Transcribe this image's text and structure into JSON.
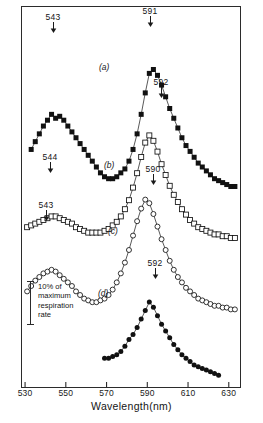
{
  "figure": {
    "axis": {
      "x_title": "Wavelength(nm)",
      "x_ticks": [
        530,
        550,
        570,
        590,
        610,
        630
      ],
      "x_min": 528,
      "x_max": 636
    },
    "scale_bar": {
      "label": "10% of\nmaximum\nrespiration\nrate",
      "fraction_of_axis": 0.1
    },
    "curve_tags": [
      {
        "label": "(a)",
        "x": 99,
        "y": 62
      },
      {
        "label": "(b)",
        "x": 104,
        "y": 160
      },
      {
        "label": "(c)",
        "x": 108,
        "y": 226
      },
      {
        "label": "(d)",
        "x": 98,
        "y": 288
      }
    ],
    "peaks": [
      {
        "label": "543",
        "x": 53,
        "y": 13,
        "series": "a"
      },
      {
        "label": "591",
        "x": 150,
        "y": 7,
        "series": "a"
      },
      {
        "label": "592",
        "x": 161,
        "y": 78,
        "series": "b"
      },
      {
        "label": "544",
        "x": 50,
        "y": 153,
        "series": "b"
      },
      {
        "label": "590",
        "x": 153,
        "y": 165,
        "series": "c"
      },
      {
        "label": "543",
        "x": 46,
        "y": 201,
        "series": "c"
      },
      {
        "label": "592",
        "x": 155,
        "y": 259,
        "series": "d"
      }
    ]
  },
  "chart_data": {
    "type": "line",
    "title": "",
    "xlabel": "Wavelength(nm)",
    "ylabel": "Respiration rate (relative, offset traces)",
    "xlim": [
      528,
      636
    ],
    "grid": false,
    "legend": "none",
    "annotations": [
      "543",
      "591",
      "592",
      "544",
      "590",
      "543",
      "592",
      "(a)",
      "(b)",
      "(c)",
      "(d)",
      "10% of maximum respiration rate"
    ],
    "series": [
      {
        "name": "(a)",
        "marker": "filled-square",
        "color": "#111111",
        "peaks_nm": [
          543,
          591
        ],
        "x": [
          533,
          535,
          537,
          539,
          541,
          543,
          545,
          547,
          549,
          551,
          553,
          555,
          557,
          559,
          561,
          563,
          565,
          567,
          569,
          571,
          573,
          575,
          577,
          579,
          581,
          583,
          585,
          587,
          589,
          591,
          593,
          595,
          597,
          599,
          601,
          603,
          605,
          607,
          609,
          611,
          613,
          615,
          617,
          619,
          621,
          623,
          625,
          627,
          629,
          631,
          633
        ],
        "y": [
          29,
          33,
          37,
          41,
          44,
          47,
          45,
          46,
          44,
          41,
          38,
          35,
          32,
          29,
          26,
          23,
          20,
          17,
          15,
          14,
          14,
          15,
          17,
          19,
          23,
          29,
          37,
          47,
          58,
          68,
          70,
          67,
          62,
          56,
          50,
          45,
          40,
          35,
          31,
          28,
          25,
          22,
          20,
          18,
          16,
          14,
          13,
          12,
          11,
          10,
          10
        ]
      },
      {
        "name": "(b)",
        "marker": "open-square",
        "color": "#111111",
        "peaks_nm": [
          544,
          592
        ],
        "x": [
          531,
          533,
          535,
          537,
          539,
          541,
          543,
          545,
          547,
          549,
          551,
          553,
          555,
          557,
          559,
          561,
          563,
          565,
          567,
          569,
          571,
          573,
          575,
          577,
          579,
          581,
          583,
          585,
          587,
          589,
          591,
          593,
          595,
          597,
          599,
          601,
          603,
          605,
          607,
          609,
          611,
          613,
          615,
          617,
          619,
          621,
          623,
          625,
          627,
          629,
          631,
          633
        ],
        "y": [
          16,
          17,
          18,
          19,
          20,
          21,
          22,
          22,
          21,
          20,
          19,
          18,
          16,
          15,
          14,
          13,
          13,
          13,
          13,
          14,
          15,
          17,
          19,
          22,
          26,
          31,
          38,
          46,
          55,
          63,
          67,
          64,
          58,
          51,
          45,
          39,
          34,
          30,
          26,
          23,
          20,
          18,
          16,
          15,
          14,
          13,
          12,
          12,
          11,
          11,
          10,
          10
        ]
      },
      {
        "name": "(c)",
        "marker": "open-circle",
        "color": "#111111",
        "peaks_nm": [
          543,
          590
        ],
        "x": [
          531,
          533,
          535,
          537,
          539,
          541,
          543,
          545,
          547,
          549,
          551,
          553,
          555,
          557,
          559,
          561,
          563,
          565,
          567,
          569,
          571,
          573,
          575,
          577,
          579,
          581,
          583,
          585,
          587,
          589,
          591,
          593,
          595,
          597,
          599,
          601,
          603,
          605,
          607,
          609,
          611,
          613,
          615,
          617,
          619,
          621,
          623,
          625,
          627,
          629,
          631,
          633
        ],
        "y": [
          17,
          20,
          23,
          25,
          27,
          28,
          29,
          28,
          26,
          24,
          22,
          20,
          17,
          15,
          13,
          12,
          11,
          11,
          12,
          13,
          15,
          18,
          22,
          27,
          33,
          40,
          48,
          56,
          63,
          68,
          66,
          60,
          53,
          46,
          40,
          34,
          29,
          25,
          22,
          19,
          17,
          15,
          13,
          12,
          11,
          10,
          9,
          9,
          8,
          8,
          7,
          7
        ]
      },
      {
        "name": "(d)",
        "marker": "filled-circle",
        "color": "#111111",
        "peaks_nm": [
          592
        ],
        "x": [
          569,
          571,
          573,
          575,
          577,
          579,
          581,
          583,
          585,
          587,
          589,
          591,
          593,
          595,
          597,
          599,
          601,
          603,
          605,
          607,
          609,
          611,
          613,
          615,
          617,
          619,
          621,
          623,
          625
        ],
        "y": [
          14,
          14,
          15,
          16,
          18,
          21,
          25,
          28,
          32,
          37,
          42,
          47,
          44,
          39,
          34,
          30,
          26,
          22,
          19,
          16,
          14,
          12,
          10,
          9,
          8,
          7,
          6,
          5,
          4
        ]
      }
    ]
  }
}
